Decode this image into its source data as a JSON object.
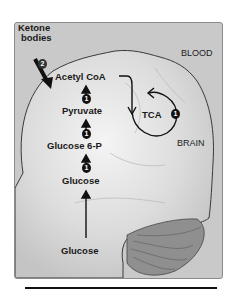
{
  "diagram": {
    "labels": {
      "ketone": "Ketone",
      "bodies": "bodies",
      "blood": "BLOOD",
      "brain": "BRAIN",
      "acetyl_coa": "Acetyl CoA",
      "pyruvate": "Pyruvate",
      "glucose6p": "Glucose 6-P",
      "glucose_brain": "Glucose",
      "glucose_blood": "Glucose",
      "tca": "TCA"
    },
    "badges": {
      "ketone_step": "2",
      "step_pyruvate_to_acetyl": "1",
      "step_g6p_to_pyruvate": "1",
      "step_glucose_to_g6p": "1",
      "tca_step": "1"
    },
    "colors": {
      "panel": "#c9c9c9",
      "brain": "#e4e4e4",
      "cerebellum": "#8f8f8f",
      "ink": "#111111"
    }
  }
}
